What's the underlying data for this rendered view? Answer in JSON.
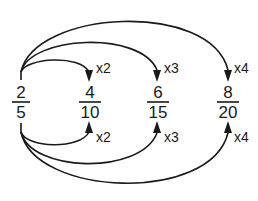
{
  "diagram": {
    "source_fraction": {
      "numerator": "2",
      "denominator": "5"
    },
    "fractions": [
      {
        "numerator": "4",
        "denominator": "10",
        "multiplier_top": "x2",
        "multiplier_bottom": "x2"
      },
      {
        "numerator": "6",
        "denominator": "15",
        "multiplier_top": "x3",
        "multiplier_bottom": "x3"
      },
      {
        "numerator": "8",
        "denominator": "20",
        "multiplier_top": "x4",
        "multiplier_bottom": "x4"
      }
    ],
    "colors": {
      "ink": "#1a1a1a",
      "background": "#ffffff"
    }
  }
}
